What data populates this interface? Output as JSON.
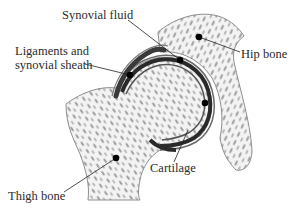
{
  "diagram": {
    "colors": {
      "background": "#ffffff",
      "bone_fill": "#f1f1f1",
      "bone_outline": "#8a8a8a",
      "trabecula": "#9a9a9a",
      "cartilage_dark": "#2a2a2a",
      "leader_line": "#222222",
      "dot": "#000000",
      "text": "#2b2b2b"
    },
    "labels": {
      "synovial_fluid": "Synovial fluid",
      "ligaments_line1": "Ligaments and",
      "ligaments_line2": "synovial sheath",
      "hip_bone": "Hip bone",
      "cartilage": "Cartilage",
      "thigh_bone": "Thigh bone"
    }
  }
}
